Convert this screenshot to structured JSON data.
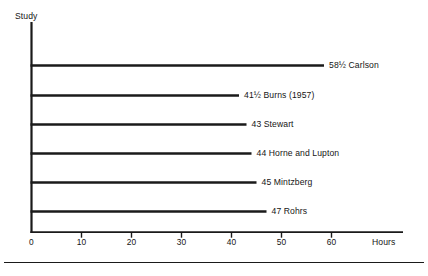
{
  "chart_data": {
    "type": "bar",
    "orientation": "horizontal",
    "title": "",
    "xlabel": "Hours",
    "ylabel": "Study",
    "xlim": [
      0,
      62.5
    ],
    "grid": false,
    "legend": false,
    "xticks": [
      "0",
      "10",
      "20",
      "30",
      "40",
      "50",
      "60"
    ],
    "xtick_values": [
      0,
      10,
      20,
      30,
      40,
      50,
      60
    ],
    "categories": [
      "Carlson",
      "Burns (1957)",
      "Stewart",
      "Horne and Lupton",
      "Mintzberg",
      "Rohrs"
    ],
    "values": [
      58.5,
      41.5,
      43,
      44,
      45,
      47
    ],
    "value_labels": [
      "58½",
      "41½",
      "43",
      "44",
      "45",
      "47"
    ],
    "bars": [
      {
        "label": "58½ Carlson",
        "value": 58.5,
        "value_text": "58½",
        "study": "Carlson"
      },
      {
        "label": "41½ Burns (1957)",
        "value": 41.5,
        "value_text": "41½",
        "study": "Burns (1957)"
      },
      {
        "label": "43 Stewart",
        "value": 43,
        "value_text": "43",
        "study": "Stewart"
      },
      {
        "label": "44 Horne and Lupton",
        "value": 44,
        "value_text": "44",
        "study": "Horne and Lupton"
      },
      {
        "label": "45 Mintzberg",
        "value": 45,
        "value_text": "45",
        "study": "Mintzberg"
      },
      {
        "label": "47 Rohrs",
        "value": 47,
        "value_text": "47",
        "study": "Rohrs"
      }
    ],
    "line_color": "#1a1a1a",
    "text_color": "#151515",
    "background": "#ffffff"
  },
  "axes": {
    "y_axis_title": "Study",
    "x_axis_title": "Hours"
  }
}
